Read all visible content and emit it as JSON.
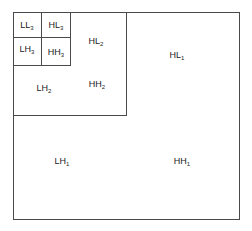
{
  "diagram": {
    "line_color": "#4a4a4a",
    "subbands": [
      {
        "id": "LL3",
        "base": "LL",
        "level": "3"
      },
      {
        "id": "HL3",
        "base": "HL",
        "level": "3"
      },
      {
        "id": "LH3",
        "base": "LH",
        "level": "3"
      },
      {
        "id": "HH3",
        "base": "HH",
        "level": "3"
      },
      {
        "id": "HL2",
        "base": "HL",
        "level": "2"
      },
      {
        "id": "LH2",
        "base": "LH",
        "level": "2"
      },
      {
        "id": "HH2",
        "base": "HH",
        "level": "2"
      },
      {
        "id": "HL1",
        "base": "HL",
        "level": "1"
      },
      {
        "id": "LH1",
        "base": "LH",
        "level": "1"
      },
      {
        "id": "HH1",
        "base": "HH",
        "level": "1"
      }
    ]
  }
}
